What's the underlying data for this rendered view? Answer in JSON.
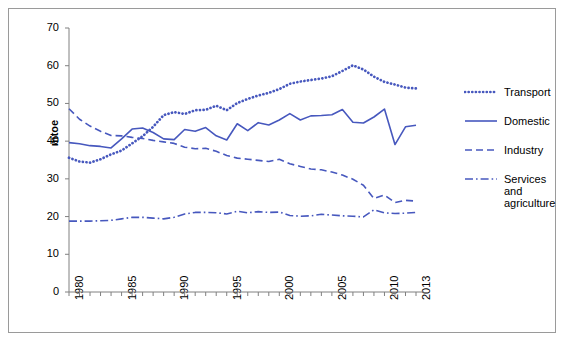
{
  "chart_data": {
    "type": "line",
    "title": "",
    "xlabel": "",
    "ylabel": "mtoe",
    "xlim": [
      1980,
      2013
    ],
    "ylim": [
      0,
      70
    ],
    "ytick_values": [
      0,
      10,
      20,
      30,
      40,
      50,
      60,
      70
    ],
    "xtick_labels": [
      "1980",
      "1985",
      "1990",
      "1995",
      "2000",
      "2005",
      "2010",
      "2013"
    ],
    "xtick_label_values": [
      1980,
      1985,
      1990,
      1995,
      2000,
      2005,
      2010,
      2013
    ],
    "x": [
      1980,
      1981,
      1982,
      1983,
      1984,
      1985,
      1986,
      1987,
      1988,
      1989,
      1990,
      1991,
      1992,
      1993,
      1994,
      1995,
      1996,
      1997,
      1998,
      1999,
      2000,
      2001,
      2002,
      2003,
      2004,
      2005,
      2006,
      2007,
      2008,
      2009,
      2010,
      2011,
      2012,
      2013
    ],
    "grid": false,
    "legend_position": "right",
    "line_color": "#4758BE",
    "series": [
      {
        "name": "Transport",
        "style": "dotted",
        "values": [
          35.6,
          34.6,
          34.3,
          35.2,
          36.5,
          37.5,
          39.4,
          41.3,
          43.8,
          46.9,
          47.7,
          47.2,
          48.2,
          48.3,
          49.4,
          48.2,
          50.1,
          51.2,
          52.1,
          52.8,
          53.8,
          55.2,
          55.8,
          56.2,
          56.6,
          57.2,
          58.6,
          60.1,
          59.0,
          57.1,
          55.7,
          55.0,
          54.2,
          54.0
        ]
      },
      {
        "name": "Domestic",
        "style": "solid",
        "values": [
          39.6,
          39.3,
          38.8,
          38.6,
          38.2,
          40.6,
          43.2,
          43.5,
          42.3,
          40.6,
          40.4,
          43.1,
          42.6,
          43.6,
          41.4,
          40.3,
          44.6,
          42.8,
          44.9,
          44.3,
          45.6,
          47.3,
          45.6,
          46.7,
          46.8,
          47.0,
          48.4,
          45.0,
          44.8,
          46.4,
          48.5,
          39.1,
          43.8,
          44.2
        ]
      },
      {
        "name": "Industry",
        "style": "dashed",
        "values": [
          48.6,
          45.8,
          44.0,
          42.6,
          41.5,
          41.4,
          41.0,
          40.7,
          40.2,
          39.8,
          39.4,
          38.4,
          38.0,
          38.1,
          37.3,
          36.2,
          35.5,
          35.2,
          34.9,
          34.6,
          35.2,
          34.0,
          33.3,
          32.6,
          32.4,
          31.8,
          31.0,
          29.9,
          28.3,
          24.8,
          25.7,
          23.7,
          24.3,
          24.1
        ]
      },
      {
        "name": "Services and agriculture",
        "style": "dashdot",
        "values": [
          18.8,
          18.8,
          18.8,
          18.9,
          19.0,
          19.4,
          19.8,
          19.8,
          19.6,
          19.4,
          19.8,
          20.7,
          21.1,
          21.1,
          21.0,
          20.7,
          21.4,
          21.0,
          21.3,
          21.1,
          21.2,
          20.3,
          20.1,
          20.2,
          20.6,
          20.4,
          20.2,
          20.1,
          19.9,
          21.8,
          21.0,
          20.8,
          20.9,
          21.1
        ]
      }
    ]
  },
  "legend": {
    "items": [
      {
        "label": "Transport",
        "style": "dotted"
      },
      {
        "label": "Domestic",
        "style": "solid"
      },
      {
        "label": "Industry",
        "style": "dashed"
      },
      {
        "label": "Services and agriculture",
        "style": "dashdot"
      }
    ]
  }
}
